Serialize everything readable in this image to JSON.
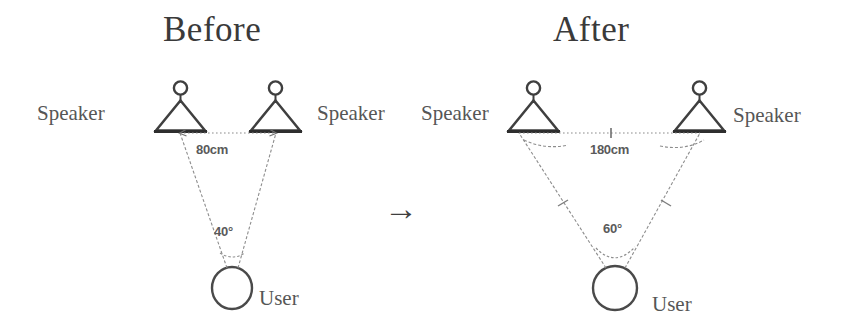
{
  "page": {
    "background_color": "#ffffff",
    "ink_color": "#4f4f4f",
    "line_color": "#7a7a7a"
  },
  "transition": {
    "arrow_glyph": "→",
    "name": "right-arrow"
  },
  "panels": [
    {
      "id": "before",
      "title": "Before",
      "speaker_label_left": "Speaker",
      "speaker_label_right": "Speaker",
      "user_label": "User",
      "distance_label": "80cm",
      "angle_label": "40°",
      "distance_value": 80,
      "distance_unit": "cm",
      "angle_value": 40,
      "angle_unit": "degrees",
      "speaker_icon": "speaker-on-stand-icon",
      "user_icon": "user-head-icon"
    },
    {
      "id": "after",
      "title": "After",
      "speaker_label_left": "Speaker",
      "speaker_label_right": "Speaker",
      "user_label": "User",
      "distance_label": "180cm",
      "angle_label": "60°",
      "distance_value": 180,
      "distance_unit": "cm",
      "angle_value": 60,
      "angle_unit": "degrees",
      "speaker_icon": "speaker-on-stand-icon",
      "user_icon": "user-head-icon"
    }
  ]
}
